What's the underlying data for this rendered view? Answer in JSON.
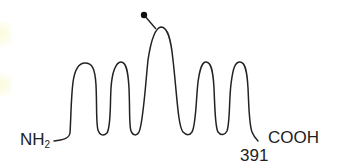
{
  "diagram": {
    "n_terminus": {
      "label": "NH",
      "subscript": "2"
    },
    "c_terminus": {
      "label": "COOH",
      "residue_number": "391"
    },
    "helices": 5,
    "modification_marker": "glycosylation-dot",
    "line_color": "#222222",
    "background": "#ffffff"
  }
}
